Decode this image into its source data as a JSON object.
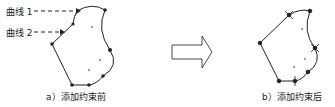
{
  "left_panel": {
    "caption": "a）添加约束前",
    "curve_labels": [
      "曲线 1",
      "曲线 2"
    ]
  },
  "right_panel": {
    "caption": "b）添加约束后"
  },
  "arrow": {
    "direction": "right",
    "style": "hollow"
  },
  "colors": {
    "stroke": "#222222",
    "background": "#ffffff"
  }
}
